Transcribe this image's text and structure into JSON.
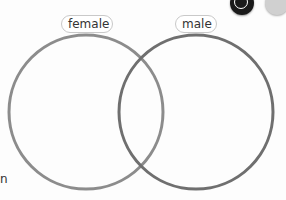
{
  "diagram": {
    "type": "venn",
    "sets": [
      {
        "label": "female",
        "color": "#8a8a8a"
      },
      {
        "label": "male",
        "color": "#6e6e6e"
      }
    ]
  },
  "toolbar": {
    "tools": [
      {
        "name": "pen-tool"
      },
      {
        "name": "eraser-tool"
      }
    ]
  },
  "edge_text": "n"
}
